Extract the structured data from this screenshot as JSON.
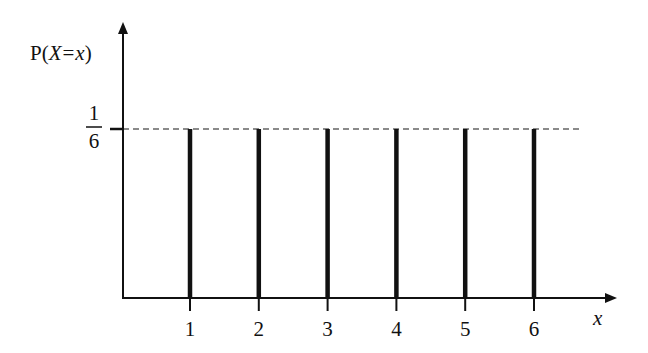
{
  "chart_data": {
    "type": "bar",
    "title": "",
    "xlabel": "x",
    "ylabel": "P(X = x)",
    "ylabel_parts": {
      "p": "P",
      "open": "(",
      "X": "X",
      "eq": "=",
      "x": "x",
      "close": ")"
    },
    "categories": [
      "1",
      "2",
      "3",
      "4",
      "5",
      "6"
    ],
    "values": [
      0.1667,
      0.1667,
      0.1667,
      0.1667,
      0.1667,
      0.1667
    ],
    "y_tick_label": {
      "numerator": "1",
      "denominator": "6"
    },
    "reference_line": {
      "value": "1/6",
      "style": "dashed",
      "color": "#888888"
    },
    "bar_style": "stick",
    "bar_color": "#111111",
    "grid": false,
    "legend": null
  }
}
